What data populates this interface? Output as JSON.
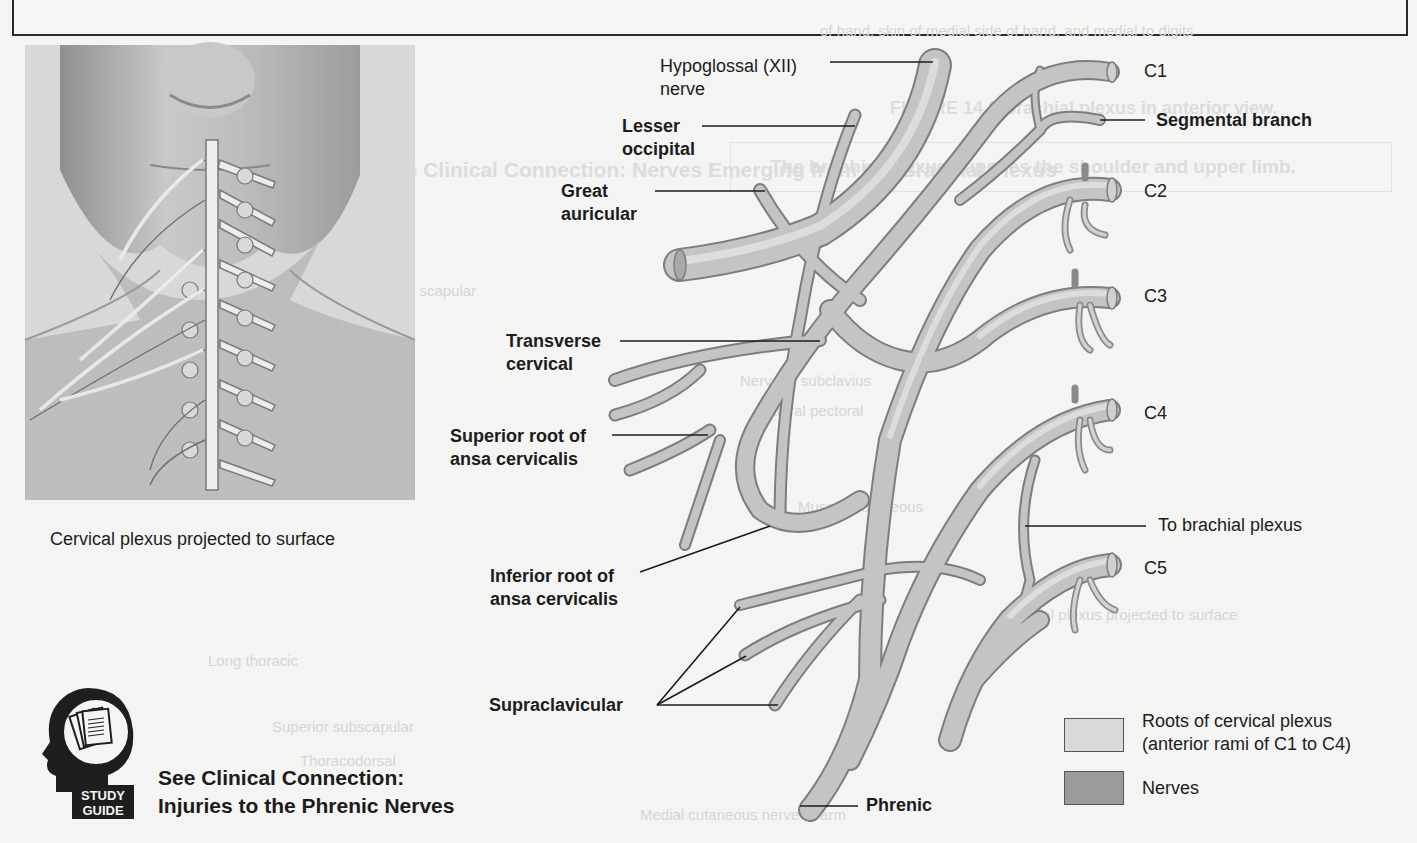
{
  "figure": {
    "left_panel": {
      "caption": "Cervical plexus projected to surface"
    },
    "labels_left": [
      {
        "id": "hypoglossal",
        "line1": "Hypoglossal (XII)",
        "line2": "nerve",
        "bold": false
      },
      {
        "id": "lesser-occipital",
        "line1": "Lesser",
        "line2": "occipital",
        "bold": true
      },
      {
        "id": "great-auricular",
        "line1": "Great",
        "line2": "auricular",
        "bold": true
      },
      {
        "id": "transverse-cervical",
        "line1": "Transverse",
        "line2": "cervical",
        "bold": true
      },
      {
        "id": "superior-root",
        "line1": "Superior root of",
        "line2": "ansa cervicalis",
        "bold": true
      },
      {
        "id": "inferior-root",
        "line1": "Inferior root of",
        "line2": "ansa cervicalis",
        "bold": true
      },
      {
        "id": "supraclavicular",
        "line1": "Supraclavicular",
        "line2": "",
        "bold": true
      },
      {
        "id": "phrenic",
        "line1": "Phrenic",
        "line2": "",
        "bold": true
      }
    ],
    "labels_right": [
      {
        "id": "c1",
        "text": "C1"
      },
      {
        "id": "segmental-branch",
        "text": "Segmental branch"
      },
      {
        "id": "c2",
        "text": "C2"
      },
      {
        "id": "c3",
        "text": "C3"
      },
      {
        "id": "c4",
        "text": "C4"
      },
      {
        "id": "to-brachial-plexus",
        "text": "To brachial plexus"
      },
      {
        "id": "c5",
        "text": "C5"
      }
    ],
    "legend": [
      {
        "label_line1": "Roots of cervical plexus",
        "label_line2": "(anterior rami of C1 to C4)",
        "color": "#d9d9d9"
      },
      {
        "label_line1": "Nerves",
        "label_line2": "",
        "color": "#9a9a9a"
      }
    ],
    "study_guide": {
      "badge_line1": "STUDY",
      "badge_line2": "GUIDE",
      "line1": "See Clinical Connection:",
      "line2": "Injuries to the Phrenic Nerves"
    }
  },
  "bleed_through": {
    "top_lines": [
      "of hand, skin of medial side of hand, and medial to digits",
      "Minor extensors, muscles of thenar eminence, flexor pollicis, skin of medial palm"
    ],
    "figure_title": "FIGURE 14.8  Brachial plexus in anterior view.",
    "box_text": "The brachial plexus supplies the shoulder and upper limb.",
    "clinical_bleed": "See Clinical Connection: Nerves Emerging from the Brachial Plexus",
    "misc": [
      "Dorsal scapular",
      "Suprascapular",
      "Nerve to subclavius",
      "Lateral pectoral",
      "Musculocutaneous",
      "Axillary",
      "Median",
      "Radial",
      "Ulnar",
      "Medial cutaneous nerve of forearm",
      "Medial cutaneous nerve of arm",
      "Long thoracic",
      "Superior subscapular",
      "Thoracodorsal",
      "Inferior subscapular",
      "Roots",
      "Trunks",
      "C8",
      "T1",
      "T2",
      "Brachial plexus projected to surface"
    ]
  }
}
